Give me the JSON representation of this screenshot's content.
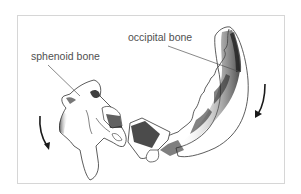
{
  "diagram": {
    "labels": {
      "sphenoid": "sphenoid bone",
      "occipital": "occipital bone"
    },
    "icons": [
      "rotation-arrow-left",
      "rotation-arrow-right"
    ],
    "colors": {
      "frame_border": "#d6d6d6",
      "bone_outline": "#333333",
      "shading": "#222222",
      "label_text": "#505050"
    }
  }
}
